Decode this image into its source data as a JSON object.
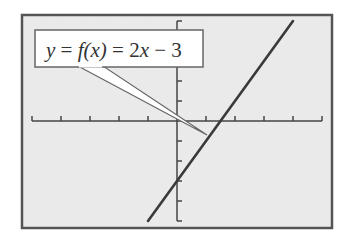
{
  "chart_data": {
    "type": "line",
    "title": "",
    "annotation": "y = f(x) = 2x − 3",
    "annotation_parts": {
      "y": "y",
      "eq1": " = ",
      "f": "f",
      "paren_x": "(x)",
      "eq2": " = 2",
      "x": "x",
      "tail": " − 3"
    },
    "xlabel": "",
    "ylabel": "",
    "xlim": [
      -5,
      5
    ],
    "ylim": [
      -5,
      5
    ],
    "x_ticks": [
      -5,
      -4,
      -3,
      -2,
      -1,
      0,
      1,
      2,
      3,
      4,
      5
    ],
    "y_ticks": [
      -5,
      -4,
      -3,
      -2,
      -1,
      0,
      1,
      2,
      3,
      4,
      5
    ],
    "tick_labels_shown": false,
    "grid": false,
    "legend": null,
    "series": [
      {
        "name": "f(x) = 2x - 3",
        "slope": 2,
        "intercept": -3,
        "x": [
          -1,
          4
        ],
        "y": [
          -5,
          5
        ]
      }
    ],
    "key_points": {
      "y_intercept": [
        0,
        -3
      ],
      "x_intercept": [
        1.5,
        0
      ]
    }
  },
  "colors": {
    "frame": "#555555",
    "plot_background": "#ececec",
    "axis": "#444444",
    "line": "#3a3a3a",
    "label_box": "#ffffff",
    "label_border": "#666666"
  }
}
